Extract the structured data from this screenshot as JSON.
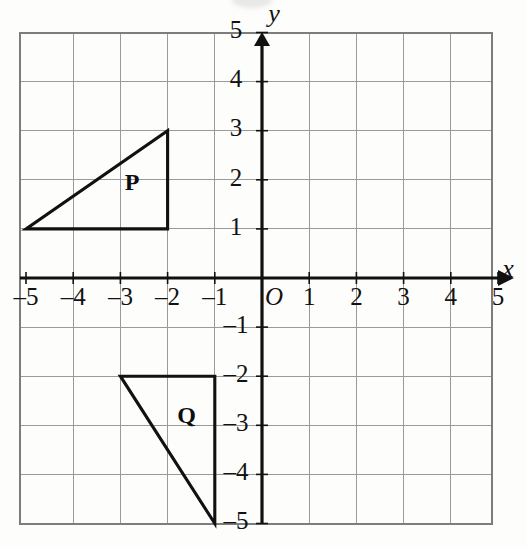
{
  "figure": {
    "axis_labels": {
      "x": "x",
      "y": "y",
      "origin": "O"
    },
    "colors": {
      "grid": "#9a9a9a",
      "grid_border": "#7d7d7d",
      "axis": "#111111",
      "shape_stroke": "#111111",
      "label_text": "#121212",
      "background": "#fdfdfc"
    }
  },
  "chart_data": {
    "type": "scatter",
    "xlabel": "x",
    "ylabel": "y",
    "xlim": [
      -5,
      5
    ],
    "ylim": [
      -5,
      5
    ],
    "grid": true,
    "legend": "none",
    "x_ticks": [
      -5,
      -4,
      -3,
      -2,
      -1,
      0,
      1,
      2,
      3,
      4,
      5
    ],
    "x_tick_labels": [
      "–5",
      "–4",
      "–3",
      "–2",
      "–1",
      "O",
      "1",
      "2",
      "3",
      "4",
      "5"
    ],
    "y_ticks": [
      -5,
      -4,
      -3,
      -2,
      -1,
      1,
      2,
      3,
      4,
      5
    ],
    "y_tick_labels": [
      "–5",
      "–4",
      "–3",
      "–2",
      "–1",
      "1",
      "2",
      "3",
      "4",
      "5"
    ],
    "shapes": [
      {
        "name": "P",
        "label": "P",
        "type": "triangle",
        "vertices": [
          [
            -5,
            1
          ],
          [
            -2,
            1
          ],
          [
            -2,
            3
          ]
        ],
        "label_position": [
          -2.75,
          1.9
        ]
      },
      {
        "name": "Q",
        "label": "Q",
        "type": "triangle",
        "vertices": [
          [
            -3,
            -2
          ],
          [
            -1,
            -2
          ],
          [
            -1,
            -5
          ]
        ],
        "label_position": [
          -1.6,
          -2.85
        ]
      }
    ]
  },
  "geometry": {
    "origin_px": [
      262,
      278
    ],
    "unit_px_x": 47.2,
    "unit_px_y": 49.1,
    "grid_left_px": 20,
    "grid_right_px": 492,
    "grid_top_px": 33,
    "grid_bottom_px": 524
  }
}
